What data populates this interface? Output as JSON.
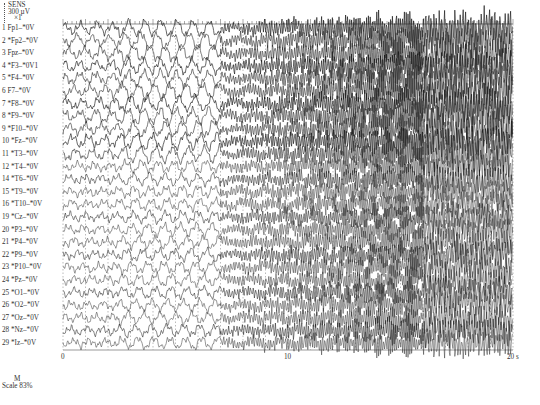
{
  "sensitivity": {
    "title": "SENS",
    "value": "300 µV",
    "multiplier": "×1"
  },
  "scale": {
    "marker": "M",
    "label": "Scale 83%"
  },
  "channels": [
    "1 Fp1–*0V",
    "2 *Fp2–*0V",
    "3 Fpz–*0V",
    "4 *F3–*0V1",
    "5 *F4–*0V",
    "6 F7–*0V",
    "7 *F8–*0V",
    "8 *F9–*0V",
    "9 *F10–*0V",
    "10 *Fz–*0V",
    "11 *T3–*0V",
    "12 *T4–*0V",
    "14 *T6–*0V",
    "15 *T9–*0V",
    "16 *T10–*0V",
    "19 *Cz–*0V",
    "20 *P3–*0V",
    "21 *P4–*0V",
    "22 *P9–*0V",
    "23 *P10–*0V",
    "24 *Pz–*0V",
    "25 *O1–*0V",
    "26 *O2–*0V",
    "27 *Oz–*0V",
    "28 *Nz–*0V",
    "29 *Iz–*0V"
  ],
  "chart_data": {
    "type": "line",
    "xlabel": "time (s)",
    "x_ticks": [
      "0",
      "10",
      "20 s"
    ],
    "xlim": [
      0,
      20
    ],
    "grid": "vertical dashed lines every 1 s",
    "sensitivity": "300 µV ×1",
    "series_count": 26
  }
}
